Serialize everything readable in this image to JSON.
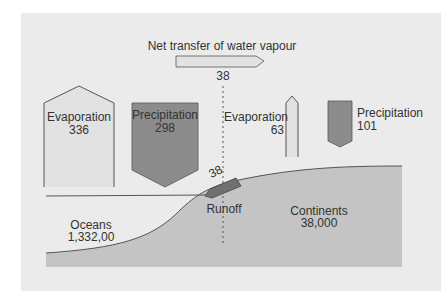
{
  "diagram": {
    "title": "Net transfer of water vapour",
    "net_transfer_value": "38",
    "ocean_evaporation": {
      "label": "Evaporation",
      "value": "336"
    },
    "ocean_precipitation": {
      "label": "Precipitation",
      "value": "298"
    },
    "land_evaporation": {
      "label": "Evaporation",
      "value": "63"
    },
    "land_precipitation": {
      "label": "Precipitation",
      "value": "101"
    },
    "runoff": {
      "label": "Runoff",
      "value": "38"
    },
    "oceans": {
      "label": "Oceans",
      "value": "1,332,00"
    },
    "continents": {
      "label": "Continents",
      "value": "38,000"
    },
    "colors": {
      "panel": "#ebebeb",
      "land": "#c4c4c4",
      "evaporation_fill": "#e2e2e2",
      "precipitation_fill": "#8c8c8c",
      "runoff_fill": "#707070",
      "outline": "#555555"
    }
  }
}
